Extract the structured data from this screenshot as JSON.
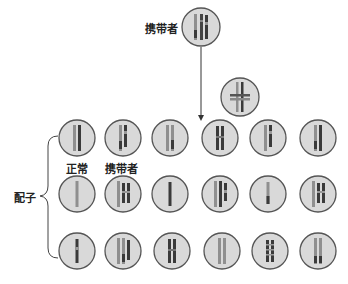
{
  "labels": {
    "parent": "携带者",
    "normal": "正常",
    "carrier": "携带者",
    "gametes": "配子"
  },
  "colors": {
    "cell_fill": "#d9d9d9",
    "cell_stroke": "#555555",
    "chrom_dark": "#3a3a3a",
    "chrom_light": "#8f8f8f",
    "arrow": "#333333"
  },
  "diagram": {
    "parent_cell": {
      "cx": 201,
      "cy": 27,
      "r": 19,
      "type": "carrier-pair"
    },
    "meiosis_cell": {
      "cx": 240,
      "cy": 97,
      "r": 19,
      "type": "quadrivalent-cross"
    },
    "gamete_rows": 3,
    "gamete_cols": 6,
    "gamete_cells": [
      [
        "normal-pair",
        "carrier-pair",
        "pair-light-dark",
        "pair-dark-dark",
        "pair-light-banded",
        "pair-dark-short"
      ],
      [
        "single-light",
        "triple-banded",
        "single-dark",
        "triple-mixed",
        "single-dark-short",
        "triple-banded"
      ],
      [
        "single-banded",
        "triple-light-dark",
        "pair-dark-dark",
        "pair-light-light",
        "pair-banded-banded",
        "pair-dark-tips"
      ]
    ]
  }
}
